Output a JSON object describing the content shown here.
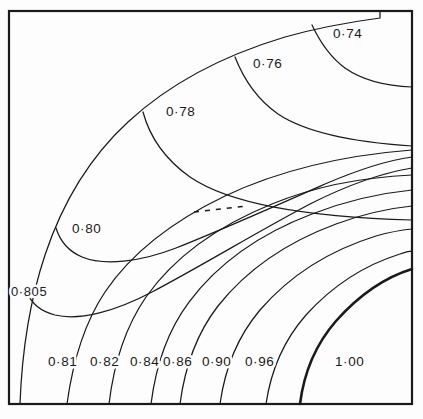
{
  "figure": {
    "type": "contour-plot",
    "background_color": "#fdfdfd",
    "line_color": "#1a1a1a",
    "frame": {
      "name": "plot-frame",
      "x": 9,
      "y": 11,
      "width": 403,
      "height": 393,
      "stroke_width": 2.2
    }
  },
  "chart_data": {
    "type": "contour",
    "title": "",
    "xlabel": "",
    "ylabel": "",
    "grid": false,
    "legend": "none",
    "xlim": [
      0,
      1
    ],
    "ylim": [
      0,
      1
    ],
    "levels": [
      0.74,
      0.76,
      0.78,
      0.8,
      0.805,
      0.81,
      0.82,
      0.84,
      0.86,
      0.9,
      0.96,
      1.0
    ],
    "level_labels": [
      "0·74",
      "0·76",
      "0·78",
      "0·80",
      "0·805",
      "0·81",
      "0·82",
      "0·84",
      "0·86",
      "0·90",
      "0·96",
      "1·00"
    ],
    "bold_levels": [
      1.0
    ],
    "dashed_segments": 1,
    "annotations": [
      {
        "text": "0·74",
        "x": 333,
        "y": 38,
        "level": 0.74
      },
      {
        "text": "0·76",
        "x": 253,
        "y": 68,
        "level": 0.76
      },
      {
        "text": "0·78",
        "x": 166,
        "y": 116,
        "level": 0.78
      },
      {
        "text": "0·80",
        "x": 72,
        "y": 233,
        "level": 0.8
      },
      {
        "text": "0·805",
        "x": 11,
        "y": 296,
        "level": 0.805
      },
      {
        "text": "0·81",
        "x": 48,
        "y": 366,
        "level": 0.81
      },
      {
        "text": "0·82",
        "x": 90,
        "y": 366,
        "level": 0.82
      },
      {
        "text": "0·84",
        "x": 130,
        "y": 366,
        "level": 0.84
      },
      {
        "text": "0·86",
        "x": 163,
        "y": 366,
        "level": 0.86
      },
      {
        "text": "0·90",
        "x": 202,
        "y": 366,
        "level": 0.9
      },
      {
        "text": "0·96",
        "x": 245,
        "y": 366,
        "level": 0.96
      },
      {
        "text": "1·00",
        "x": 335,
        "y": 366,
        "level": 1.0
      }
    ],
    "contour_paths": [
      {
        "level": 0.78,
        "name": "contour-outer-envelope",
        "d": "M 20 404 C 22 350 30 300 45 255 C 62 204 90 157 128 122 C 170 83 225 55 285 37 C 317 28 350 22 380 18 L 380 11",
        "bold": false
      },
      {
        "level": 0.74,
        "name": "contour-074",
        "d": "M 312 25 C 320 42 330 57 345 68 C 362 80 385 86 412 87",
        "bold": false
      },
      {
        "level": 0.76,
        "name": "contour-076",
        "d": "M 235 57 C 244 80 258 100 278 114 C 305 132 350 142 412 146",
        "bold": false
      },
      {
        "level": 0.78,
        "name": "contour-078",
        "d": "M 143 112 C 150 138 166 160 190 177 C 228 203 300 217 412 220",
        "bold": false
      },
      {
        "level": 0.8,
        "name": "contour-080",
        "d": "M 56 228 C 60 241 68 251 82 257 C 104 266 140 262 176 248 C 224 229 280 204 325 184 C 360 169 390 160 412 157",
        "bold": false
      },
      {
        "level": 0.805,
        "name": "contour-0805",
        "d": "M 27 292 C 31 303 40 311 55 315 C 80 321 116 311 152 292 C 205 264 262 229 312 203 C 352 183 388 172 412 168",
        "bold": false
      },
      {
        "level": 0.81,
        "name": "contour-081",
        "d": "M 67 404 C 73 360 85 322 105 292 C 132 252 175 220 225 196 C 282 169 348 155 412 150",
        "bold": false
      },
      {
        "level": 0.82,
        "name": "contour-082",
        "d": "M 109 404 C 114 362 126 326 146 297 C 175 256 220 225 272 204 C 318 185 368 177 412 175",
        "bold": false
      },
      {
        "level": 0.84,
        "name": "contour-084",
        "d": "M 151 404 C 156 364 168 330 189 302 C 219 262 262 233 312 214 C 348 200 382 193 412 190",
        "bold": false
      },
      {
        "level": 0.86,
        "name": "contour-086",
        "d": "M 180 404 C 185 366 197 333 218 306 C 248 268 290 241 336 224 C 366 213 392 208 412 206",
        "bold": false
      },
      {
        "level": 0.9,
        "name": "contour-090",
        "d": "M 220 404 C 225 368 238 336 260 310 C 292 273 334 249 376 236 C 390 232 402 230 412 229",
        "bold": false
      },
      {
        "level": 0.96,
        "name": "contour-096",
        "d": "M 266 404 C 271 370 284 340 306 315 C 334 284 368 264 400 254 C 405 252 409 251 412 251",
        "bold": false
      },
      {
        "level": 1.0,
        "name": "contour-100",
        "d": "M 300 404 C 304 372 316 344 336 321 C 360 294 386 277 412 269",
        "bold": true
      }
    ],
    "dashed_path": {
      "name": "contour-dashed-segment",
      "d": "M 194 212 L 246 206"
    }
  }
}
